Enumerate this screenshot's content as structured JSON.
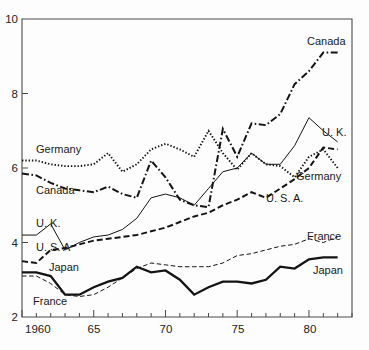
{
  "chart_data": {
    "type": "line",
    "title": "",
    "subtitle": "",
    "xlabel": "",
    "ylabel": "",
    "xlim": [
      1960,
      1983
    ],
    "ylim": [
      2,
      10
    ],
    "grid": false,
    "legend_position": "inline-endpoint-labels",
    "x_tick_labels": [
      "1960",
      "65",
      "70",
      "75",
      "80"
    ],
    "x_tick_values": [
      1960,
      1965,
      1970,
      1975,
      1980
    ],
    "x_minor_ticks": [
      1961,
      1962,
      1963,
      1964,
      1966,
      1967,
      1968,
      1969,
      1971,
      1972,
      1973,
      1974,
      1976,
      1977,
      1978,
      1979,
      1981,
      1982,
      1983
    ],
    "y_tick_labels": [
      "2",
      "4",
      "6",
      "8",
      "10"
    ],
    "y_tick_values": [
      2,
      4,
      6,
      8,
      10
    ],
    "x": [
      1960,
      1961,
      1962,
      1963,
      1964,
      1965,
      1966,
      1967,
      1968,
      1969,
      1970,
      1971,
      1972,
      1973,
      1974,
      1975,
      1976,
      1977,
      1978,
      1979,
      1980,
      1981,
      1982
    ],
    "series": [
      {
        "name": "Canada",
        "style": "dash-dot",
        "label_left": "Canada",
        "label_right": "Canada",
        "values": [
          5.85,
          5.8,
          5.6,
          5.45,
          5.4,
          5.35,
          5.5,
          5.3,
          5.2,
          6.2,
          5.75,
          5.15,
          5.0,
          4.95,
          7.05,
          6.3,
          7.2,
          7.15,
          7.45,
          8.25,
          8.6,
          9.1,
          9.1
        ]
      },
      {
        "name": "Germany",
        "style": "dotted",
        "label_left": "Germany",
        "label_right": "Germany",
        "values": [
          6.2,
          6.2,
          6.1,
          6.05,
          6.05,
          6.1,
          6.4,
          5.9,
          6.1,
          6.5,
          6.65,
          6.5,
          6.3,
          7.0,
          6.4,
          5.95,
          6.4,
          6.1,
          6.05,
          5.75,
          6.3,
          6.5,
          6.0
        ]
      },
      {
        "name": "U. K.",
        "style": "thin-solid",
        "label_left": "U. K.",
        "label_right": "U. K.",
        "values": [
          4.2,
          4.2,
          4.5,
          3.8,
          4.0,
          4.15,
          4.2,
          4.35,
          4.65,
          5.2,
          5.3,
          5.2,
          5.0,
          5.45,
          5.9,
          6.0,
          6.4,
          6.1,
          6.1,
          6.6,
          7.35,
          7.0,
          6.7
        ]
      },
      {
        "name": "U. S. A.",
        "style": "dashed",
        "label_left": "U. S. A",
        "label_right": "U. S. A.",
        "values": [
          3.5,
          3.45,
          3.8,
          3.85,
          3.95,
          4.05,
          4.1,
          4.15,
          4.2,
          4.3,
          4.4,
          4.55,
          4.7,
          4.8,
          5.0,
          5.15,
          5.35,
          5.2,
          5.45,
          5.7,
          6.0,
          6.55,
          6.5
        ]
      },
      {
        "name": "Japan",
        "style": "thick-solid",
        "label_left": "Japan",
        "label_right": "Japan",
        "values": [
          3.2,
          3.2,
          3.1,
          2.6,
          2.6,
          2.8,
          2.95,
          3.05,
          3.35,
          3.2,
          3.25,
          3.0,
          2.6,
          2.8,
          2.95,
          2.95,
          2.9,
          3.0,
          3.35,
          3.3,
          3.55,
          3.6,
          3.6
        ]
      },
      {
        "name": "France",
        "style": "thin-dashed",
        "label_left": "France",
        "label_right": "France",
        "values": [
          3.1,
          3.1,
          2.9,
          2.6,
          2.55,
          2.6,
          2.8,
          3.05,
          3.3,
          3.45,
          3.4,
          3.35,
          3.35,
          3.35,
          3.45,
          3.65,
          3.7,
          3.8,
          3.9,
          3.95,
          4.1,
          4.0,
          4.15
        ]
      }
    ]
  },
  "axis": {
    "y_top_label": "10",
    "y_mid_high_label": "8",
    "y_mid_label": "6",
    "y_mid_low_label": "4",
    "y_bottom_label": "2",
    "x_start_label": "1960",
    "x_65_label": "65",
    "x_70_label": "70",
    "x_75_label": "75",
    "x_80_label": "80"
  },
  "labels": {
    "germany_left": "Germany",
    "canada_left": "Canada",
    "uk_left": "U. K.",
    "usa_left": "U. S. A",
    "japan_left": "Japan",
    "france_left": "France",
    "canada_right": "Canada",
    "uk_right": "U. K.",
    "germany_right": "Germany",
    "usa_right": "U. S. A.",
    "france_right": "France",
    "japan_right": "Japan"
  },
  "colors": {
    "background": "#fdfdfd",
    "ink": "#141414",
    "frame": "#4a4a4a"
  }
}
